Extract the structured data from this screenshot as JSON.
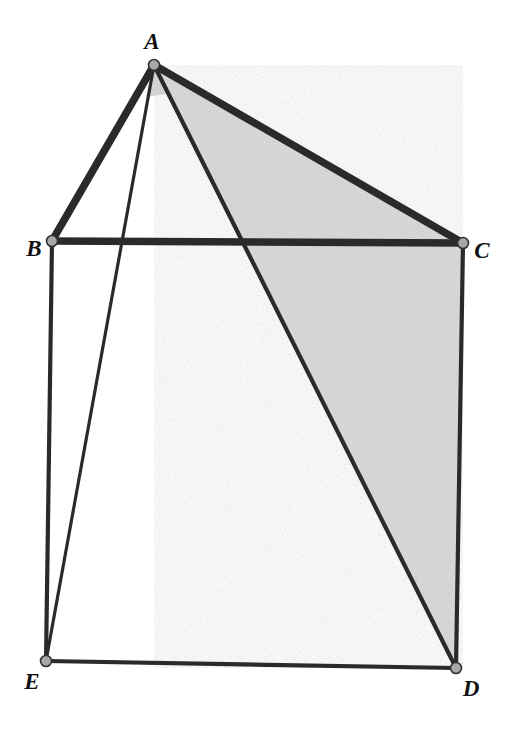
{
  "figure": {
    "canvas": {
      "width": 509,
      "height": 734,
      "background": "#ffffff"
    },
    "style": {
      "stroke_color": "#2b2b2b",
      "shade_fill": "#dcdcdc",
      "shade_fill_light": "#d2d2d2",
      "vertex_fill": "#a8a8a8",
      "vertex_stroke": "#333333",
      "label_color": "#111111"
    },
    "vertices": [
      {
        "id": "A",
        "label": "A",
        "x": 154,
        "y": 65,
        "label_x": 152,
        "label_y": 41,
        "dot_r": 5.5
      },
      {
        "id": "B",
        "label": "B",
        "x": 52,
        "y": 241,
        "label_x": 34,
        "label_y": 248,
        "dot_r": 5.5
      },
      {
        "id": "C",
        "label": "C",
        "x": 463,
        "y": 243,
        "label_x": 482,
        "label_y": 250,
        "dot_r": 5.5
      },
      {
        "id": "D",
        "label": "D",
        "x": 456,
        "y": 668,
        "label_x": 471,
        "label_y": 688,
        "dot_r": 5.5
      },
      {
        "id": "E",
        "label": "E",
        "x": 46,
        "y": 661,
        "label_x": 32,
        "label_y": 681,
        "dot_r": 5.5
      }
    ],
    "edges": [
      {
        "id": "AB",
        "from": "A",
        "to": "B",
        "width": 7.5,
        "emphasis": "thick"
      },
      {
        "id": "AC",
        "from": "A",
        "to": "C",
        "width": 7.5,
        "emphasis": "thick"
      },
      {
        "id": "BC",
        "from": "B",
        "to": "C",
        "width": 7.5,
        "emphasis": "thick"
      },
      {
        "id": "AD",
        "from": "A",
        "to": "D",
        "width": 4.2,
        "emphasis": "medium"
      },
      {
        "id": "AE",
        "from": "A",
        "to": "E",
        "width": 3.2,
        "emphasis": "thin"
      },
      {
        "id": "BE",
        "from": "B",
        "to": "E",
        "width": 4.2,
        "emphasis": "medium"
      },
      {
        "id": "ED",
        "from": "E",
        "to": "D",
        "width": 4.2,
        "emphasis": "medium"
      },
      {
        "id": "CD",
        "from": "C",
        "to": "D",
        "width": 4.2,
        "emphasis": "medium"
      }
    ],
    "shaded_regions": [
      {
        "id": "triangle-ACD",
        "vertices": [
          "A",
          "C",
          "D"
        ],
        "fill": "#dcdcdc"
      },
      {
        "id": "angle-wedge-at-A",
        "points": "154,65 146,97 172,93",
        "fill": "#d2d2d2"
      }
    ]
  }
}
